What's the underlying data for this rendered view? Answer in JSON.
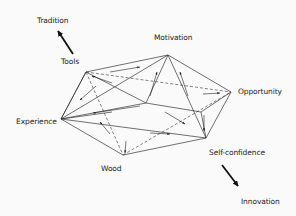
{
  "diagram": {
    "title": "",
    "colors": {
      "background": "#fafafa",
      "line": "#333333",
      "text": "#222222"
    },
    "labels": {
      "tradition": "Tradition",
      "tools": "Tools",
      "motivation": "Motivation",
      "opportunity": "Opportunity",
      "experience": "Experience",
      "wood": "Wood",
      "self_confidence": "Self-confidence",
      "innovation": "Innovation"
    },
    "vertices": [
      {
        "id": "tools",
        "x": 86,
        "y": 72
      },
      {
        "id": "motivation",
        "x": 168,
        "y": 55
      },
      {
        "id": "opportunity",
        "x": 231,
        "y": 92
      },
      {
        "id": "self_confidence",
        "x": 206,
        "y": 138
      },
      {
        "id": "wood",
        "x": 123,
        "y": 155
      },
      {
        "id": "experience",
        "x": 61,
        "y": 119
      },
      {
        "id": "inner_center",
        "x": 146,
        "y": 103
      },
      {
        "id": "inner_left",
        "x": 112,
        "y": 112
      },
      {
        "id": "inner_right",
        "x": 201,
        "y": 112
      }
    ],
    "axis_arrows": [
      {
        "from": "tools",
        "to": "tradition",
        "direction": "up-left"
      },
      {
        "from": "self_confidence",
        "to": "innovation",
        "direction": "down-right"
      }
    ]
  }
}
